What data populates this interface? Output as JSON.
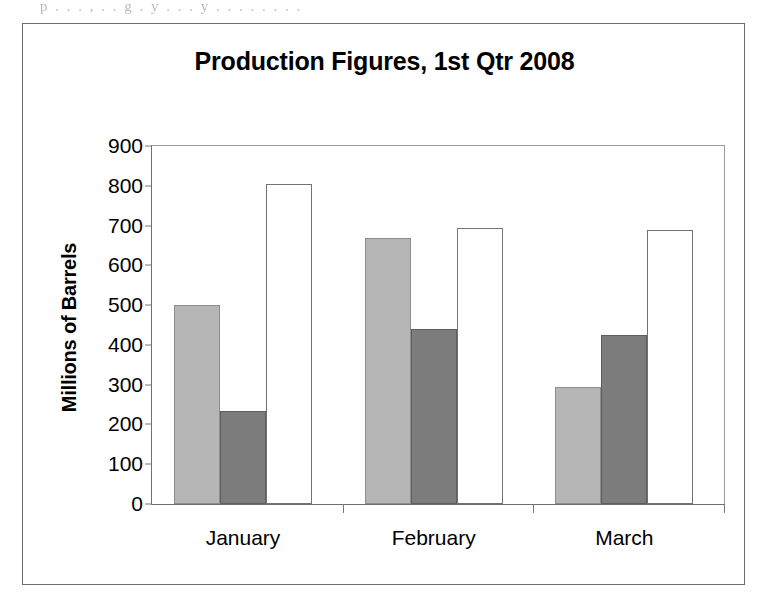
{
  "page": {
    "scan_artifact_text": "p . . . , . . g . y . . . y . . . . . . . ."
  },
  "chart_data": {
    "type": "bar",
    "title": "Production Figures, 1st Qtr 2008",
    "xlabel": "",
    "ylabel": "Millions of Barrels",
    "categories": [
      "January",
      "February",
      "March"
    ],
    "ylim": [
      0,
      900
    ],
    "ytick_step": 100,
    "ytick_labels": [
      "900",
      "800",
      "700",
      "600",
      "500",
      "400",
      "300",
      "200",
      "100",
      "0"
    ],
    "ytick_values": [
      900,
      800,
      700,
      600,
      500,
      400,
      300,
      200,
      100,
      0
    ],
    "grid": false,
    "legend": "none",
    "series": [
      {
        "name": "series-1",
        "style": "light-gray",
        "color": "#b6b6b6",
        "values": [
          500,
          670,
          295
        ]
      },
      {
        "name": "series-2",
        "style": "dark-gray",
        "color": "#7c7c7c",
        "values": [
          235,
          440,
          425
        ]
      },
      {
        "name": "series-3",
        "style": "white",
        "color": "#ffffff",
        "values": [
          805,
          695,
          690
        ]
      }
    ]
  }
}
